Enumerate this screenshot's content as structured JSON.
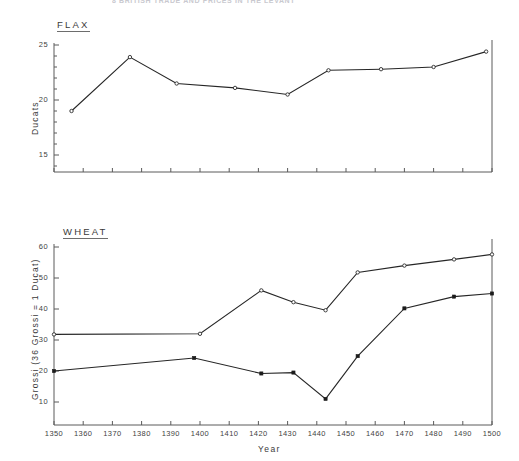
{
  "page": {
    "running_head": "8  BRITISH  TRADE  AND  PRICES  IN  THE  LEVANT"
  },
  "labels": {
    "xlabel": "Year",
    "flax_title": "FLAX",
    "flax_ylabel": "Ducats",
    "wheat_title": "WHEAT",
    "wheat_ylabel": "Grossi  (36 Grossi = 1 Ducat)"
  },
  "axis": {
    "x_ticks": [
      1350,
      1360,
      1370,
      1380,
      1390,
      1400,
      1410,
      1420,
      1430,
      1440,
      1450,
      1460,
      1470,
      1480,
      1490,
      1500
    ],
    "x_tick_labels": [
      "1350",
      "1360",
      "1370",
      "1380",
      "1390",
      "1400",
      "1410",
      "1420",
      "1430",
      "1440",
      "1450",
      "1460",
      "1470",
      "1480",
      "1490",
      "1500"
    ],
    "flax_y_ticks": [
      15,
      20,
      25
    ],
    "flax_y_tick_labels": [
      "15",
      "20",
      "25"
    ],
    "wheat_y_ticks": [
      10,
      20,
      30,
      40,
      50,
      60
    ],
    "wheat_y_tick_labels": [
      "10",
      "20",
      "30",
      "40",
      "50",
      "60"
    ]
  },
  "chart_data": [
    {
      "type": "line",
      "title": "FLAX",
      "xlabel": "Year",
      "ylabel": "Ducats",
      "xlim": [
        1350,
        1500
      ],
      "ylim": [
        13.8,
        25.6
      ],
      "grid": false,
      "legend": "none",
      "marker": "open-circle",
      "series": [
        {
          "name": "Flax price",
          "x": [
            1356,
            1376,
            1392,
            1412,
            1430,
            1444,
            1462,
            1480,
            1498
          ],
          "values": [
            19.0,
            23.9,
            21.5,
            21.1,
            20.5,
            22.7,
            22.8,
            23.0,
            24.4
          ]
        }
      ]
    },
    {
      "type": "line",
      "title": "WHEAT",
      "xlabel": "Year",
      "ylabel": "Grossi  (36 Grossi = 1 Ducat)",
      "xlim": [
        1350,
        1500
      ],
      "ylim": [
        4.5,
        62
      ],
      "grid": false,
      "legend": "none",
      "series": [
        {
          "name": "Upper wheat price",
          "marker": "open-circle",
          "x": [
            1350,
            1400,
            1421,
            1432,
            1443,
            1454,
            1470,
            1487,
            1500
          ],
          "values": [
            31.8,
            32.0,
            46.0,
            42.2,
            39.6,
            51.8,
            54.0,
            56.0,
            57.6
          ]
        },
        {
          "name": "Lower wheat price",
          "marker": "solid-square",
          "x": [
            1350,
            1398,
            1421,
            1432,
            1443,
            1454,
            1470,
            1487,
            1500
          ],
          "values": [
            20.0,
            24.2,
            19.2,
            19.5,
            11.0,
            24.8,
            40.2,
            44.0,
            45.0
          ]
        }
      ]
    }
  ]
}
